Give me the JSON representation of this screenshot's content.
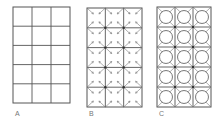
{
  "figure": {
    "panels": [
      {
        "id": "A",
        "label": "A",
        "cols": 3,
        "rows": 5,
        "style": "plain-grid"
      },
      {
        "id": "B",
        "label": "B",
        "cols": 3,
        "rows": 5,
        "style": "grid-with-arrows"
      },
      {
        "id": "C",
        "label": "C",
        "cols": 3,
        "rows": 5,
        "style": "grid-with-circles-and-arrows"
      }
    ],
    "colors": {
      "line": "#555555",
      "arrow": "#777777",
      "label": "#777777"
    }
  }
}
